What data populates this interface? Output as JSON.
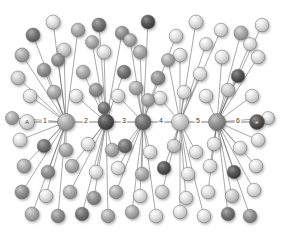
{
  "figure": {
    "type": "network-graph",
    "title": "",
    "background_color": "#ffffff",
    "width": 281,
    "height": 237
  },
  "chart_data": {
    "type": "scatter",
    "title": "",
    "xlabel": "",
    "ylabel": "",
    "legend_position": "none",
    "grid": false,
    "edge_color": "#6e6e6e",
    "edge_width": 0.6,
    "palette": {
      "light": "#dcdcdc",
      "light_mid": "#c8c8c8",
      "mid": "#a8a8a8",
      "mid_dark": "#8a8a8a",
      "dark": "#6b6b6b",
      "darkest": "#4a4a4a"
    },
    "backbone_labels": [
      "1",
      "2",
      "3",
      "4",
      "5",
      "6"
    ],
    "terminal_left_label": "A",
    "terminal_right_label": "e",
    "hubs": [
      {
        "id": "h1",
        "x": 66,
        "y": 122,
        "r": 8.5,
        "shade": "mid"
      },
      {
        "id": "h2",
        "x": 106,
        "y": 122,
        "r": 8.0,
        "shade": "darkest"
      },
      {
        "id": "h3",
        "x": 143,
        "y": 122,
        "r": 8.0,
        "shade": "dark"
      },
      {
        "id": "h4",
        "x": 180,
        "y": 122,
        "r": 8.5,
        "shade": "light_mid"
      },
      {
        "id": "h5",
        "x": 217,
        "y": 122,
        "r": 8.5,
        "shade": "mid_dark"
      }
    ],
    "terminals": [
      {
        "id": "tA",
        "x": 27,
        "y": 122,
        "r": 7.5,
        "shade": "light",
        "label": "A"
      },
      {
        "id": "tE",
        "x": 257,
        "y": 122,
        "r": 7.5,
        "shade": "darkest",
        "label": "e"
      }
    ],
    "backbone_edges": [
      {
        "from": "tA",
        "to": "h1",
        "label": "1",
        "lx": 45,
        "ly": 121
      },
      {
        "from": "h1",
        "to": "h2",
        "label": "2",
        "lx": 86,
        "ly": 121
      },
      {
        "from": "h2",
        "to": "h3",
        "label": "3",
        "lx": 124,
        "ly": 121
      },
      {
        "from": "h3",
        "to": "h4",
        "label": "4",
        "lx": 161,
        "ly": 121
      },
      {
        "from": "h4",
        "to": "h5",
        "label": "5",
        "lx": 198,
        "ly": 121
      },
      {
        "from": "h5",
        "to": "tE",
        "label": "6",
        "lx": 238,
        "ly": 121
      }
    ],
    "leaves": [
      {
        "x": 33,
        "y": 35,
        "r": 7.0,
        "shade": "dark",
        "hub": "h1"
      },
      {
        "x": 53,
        "y": 22,
        "r": 7.0,
        "shade": "light",
        "hub": "h1"
      },
      {
        "x": 78,
        "y": 30,
        "r": 6.8,
        "shade": "mid",
        "hub": "h1"
      },
      {
        "x": 99,
        "y": 25,
        "r": 7.0,
        "shade": "dark",
        "hub": "h2"
      },
      {
        "x": 122,
        "y": 33,
        "r": 6.8,
        "shade": "mid_dark",
        "hub": "h2"
      },
      {
        "x": 148,
        "y": 22,
        "r": 7.0,
        "shade": "darkest",
        "hub": "h3"
      },
      {
        "x": 176,
        "y": 36,
        "r": 6.8,
        "shade": "light",
        "hub": "h3"
      },
      {
        "x": 196,
        "y": 22,
        "r": 7.0,
        "shade": "light",
        "hub": "h4"
      },
      {
        "x": 221,
        "y": 30,
        "r": 6.8,
        "shade": "light",
        "hub": "h4"
      },
      {
        "x": 241,
        "y": 33,
        "r": 7.0,
        "shade": "mid",
        "hub": "h5"
      },
      {
        "x": 262,
        "y": 25,
        "r": 6.8,
        "shade": "light",
        "hub": "h5"
      },
      {
        "x": 22,
        "y": 55,
        "r": 7.0,
        "shade": "mid",
        "hub": "h1"
      },
      {
        "x": 44,
        "y": 70,
        "r": 6.8,
        "shade": "mid_dark",
        "hub": "h1"
      },
      {
        "x": 64,
        "y": 50,
        "r": 7.0,
        "shade": "light_mid",
        "hub": "h1"
      },
      {
        "x": 83,
        "y": 72,
        "r": 6.8,
        "shade": "mid",
        "hub": "h2"
      },
      {
        "x": 104,
        "y": 52,
        "r": 7.0,
        "shade": "light",
        "hub": "h2"
      },
      {
        "x": 124,
        "y": 72,
        "r": 6.8,
        "shade": "dark",
        "hub": "h2"
      },
      {
        "x": 140,
        "y": 52,
        "r": 6.8,
        "shade": "mid",
        "hub": "h3"
      },
      {
        "x": 158,
        "y": 78,
        "r": 7.0,
        "shade": "mid_dark",
        "hub": "h3"
      },
      {
        "x": 180,
        "y": 55,
        "r": 6.8,
        "shade": "light",
        "hub": "h4"
      },
      {
        "x": 200,
        "y": 74,
        "r": 6.8,
        "shade": "light",
        "hub": "h4"
      },
      {
        "x": 222,
        "y": 57,
        "r": 7.0,
        "shade": "light",
        "hub": "h5"
      },
      {
        "x": 238,
        "y": 76,
        "r": 6.8,
        "shade": "darkest",
        "hub": "h5"
      },
      {
        "x": 258,
        "y": 57,
        "r": 6.8,
        "shade": "light",
        "hub": "h5"
      },
      {
        "x": 18,
        "y": 78,
        "r": 7.0,
        "shade": "light_mid",
        "hub": "h1"
      },
      {
        "x": 30,
        "y": 96,
        "r": 6.8,
        "shade": "light",
        "hub": "h1"
      },
      {
        "x": 54,
        "y": 92,
        "r": 6.8,
        "shade": "mid",
        "hub": "h1"
      },
      {
        "x": 76,
        "y": 96,
        "r": 6.8,
        "shade": "light",
        "hub": "h2"
      },
      {
        "x": 96,
        "y": 90,
        "r": 6.8,
        "shade": "mid_dark",
        "hub": "h2"
      },
      {
        "x": 118,
        "y": 96,
        "r": 6.8,
        "shade": "light",
        "hub": "h3"
      },
      {
        "x": 136,
        "y": 88,
        "r": 6.8,
        "shade": "mid",
        "hub": "h3"
      },
      {
        "x": 160,
        "y": 98,
        "r": 6.8,
        "shade": "light",
        "hub": "h4"
      },
      {
        "x": 184,
        "y": 92,
        "r": 6.8,
        "shade": "light",
        "hub": "h4"
      },
      {
        "x": 206,
        "y": 96,
        "r": 6.8,
        "shade": "light",
        "hub": "h5"
      },
      {
        "x": 228,
        "y": 90,
        "r": 6.8,
        "shade": "light_mid",
        "hub": "h5"
      },
      {
        "x": 252,
        "y": 96,
        "r": 6.8,
        "shade": "light",
        "hub": "h5"
      },
      {
        "x": 20,
        "y": 140,
        "r": 7.0,
        "shade": "light",
        "hub": "h1"
      },
      {
        "x": 44,
        "y": 146,
        "r": 6.8,
        "shade": "dark",
        "hub": "h1"
      },
      {
        "x": 66,
        "y": 150,
        "r": 6.8,
        "shade": "mid",
        "hub": "h1"
      },
      {
        "x": 88,
        "y": 144,
        "r": 6.8,
        "shade": "light",
        "hub": "h2"
      },
      {
        "x": 112,
        "y": 150,
        "r": 6.8,
        "shade": "mid",
        "hub": "h2"
      },
      {
        "x": 125,
        "y": 146,
        "r": 7.0,
        "shade": "dark",
        "hub": "h3"
      },
      {
        "x": 150,
        "y": 152,
        "r": 6.8,
        "shade": "light",
        "hub": "h3"
      },
      {
        "x": 174,
        "y": 146,
        "r": 6.8,
        "shade": "light_mid",
        "hub": "h4"
      },
      {
        "x": 196,
        "y": 152,
        "r": 6.8,
        "shade": "light",
        "hub": "h4"
      },
      {
        "x": 214,
        "y": 144,
        "r": 6.8,
        "shade": "light",
        "hub": "h5"
      },
      {
        "x": 240,
        "y": 148,
        "r": 6.8,
        "shade": "light",
        "hub": "h5"
      },
      {
        "x": 258,
        "y": 140,
        "r": 6.8,
        "shade": "light",
        "hub": "h5"
      },
      {
        "x": 24,
        "y": 166,
        "r": 7.0,
        "shade": "mid",
        "hub": "h1"
      },
      {
        "x": 48,
        "y": 172,
        "r": 6.8,
        "shade": "mid_dark",
        "hub": "h1"
      },
      {
        "x": 72,
        "y": 166,
        "r": 6.8,
        "shade": "mid",
        "hub": "h2"
      },
      {
        "x": 96,
        "y": 172,
        "r": 6.8,
        "shade": "light",
        "hub": "h2"
      },
      {
        "x": 118,
        "y": 168,
        "r": 6.8,
        "shade": "light",
        "hub": "h3"
      },
      {
        "x": 142,
        "y": 174,
        "r": 6.8,
        "shade": "mid",
        "hub": "h3"
      },
      {
        "x": 164,
        "y": 168,
        "r": 6.8,
        "shade": "darkest",
        "hub": "h4"
      },
      {
        "x": 188,
        "y": 174,
        "r": 6.8,
        "shade": "light",
        "hub": "h4"
      },
      {
        "x": 210,
        "y": 166,
        "r": 6.8,
        "shade": "light",
        "hub": "h5"
      },
      {
        "x": 234,
        "y": 172,
        "r": 6.8,
        "shade": "darkest",
        "hub": "h5"
      },
      {
        "x": 256,
        "y": 166,
        "r": 6.8,
        "shade": "light",
        "hub": "h5"
      },
      {
        "x": 22,
        "y": 192,
        "r": 7.0,
        "shade": "mid_dark",
        "hub": "h1"
      },
      {
        "x": 46,
        "y": 196,
        "r": 6.8,
        "shade": "light",
        "hub": "h1"
      },
      {
        "x": 70,
        "y": 192,
        "r": 6.8,
        "shade": "mid",
        "hub": "h2"
      },
      {
        "x": 94,
        "y": 198,
        "r": 6.8,
        "shade": "mid_dark",
        "hub": "h2"
      },
      {
        "x": 116,
        "y": 192,
        "r": 6.8,
        "shade": "mid",
        "hub": "h3"
      },
      {
        "x": 140,
        "y": 196,
        "r": 6.8,
        "shade": "light",
        "hub": "h3"
      },
      {
        "x": 162,
        "y": 192,
        "r": 6.8,
        "shade": "light_mid",
        "hub": "h4"
      },
      {
        "x": 186,
        "y": 198,
        "r": 6.8,
        "shade": "light",
        "hub": "h4"
      },
      {
        "x": 208,
        "y": 192,
        "r": 6.8,
        "shade": "light",
        "hub": "h5"
      },
      {
        "x": 232,
        "y": 196,
        "r": 6.8,
        "shade": "light_mid",
        "hub": "h5"
      },
      {
        "x": 254,
        "y": 190,
        "r": 6.8,
        "shade": "light",
        "hub": "h5"
      },
      {
        "x": 32,
        "y": 214,
        "r": 7.0,
        "shade": "mid",
        "hub": "h1"
      },
      {
        "x": 58,
        "y": 216,
        "r": 6.8,
        "shade": "mid_dark",
        "hub": "h1"
      },
      {
        "x": 82,
        "y": 214,
        "r": 6.8,
        "shade": "dark",
        "hub": "h2"
      },
      {
        "x": 108,
        "y": 216,
        "r": 6.8,
        "shade": "mid",
        "hub": "h2"
      },
      {
        "x": 132,
        "y": 212,
        "r": 6.8,
        "shade": "mid",
        "hub": "h3"
      },
      {
        "x": 156,
        "y": 216,
        "r": 6.8,
        "shade": "light",
        "hub": "h3"
      },
      {
        "x": 180,
        "y": 212,
        "r": 6.8,
        "shade": "light",
        "hub": "h4"
      },
      {
        "x": 204,
        "y": 216,
        "r": 6.8,
        "shade": "light",
        "hub": "h4"
      },
      {
        "x": 228,
        "y": 214,
        "r": 6.8,
        "shade": "dark",
        "hub": "h5"
      },
      {
        "x": 250,
        "y": 216,
        "r": 6.8,
        "shade": "mid_dark",
        "hub": "h5"
      },
      {
        "x": 12,
        "y": 118,
        "r": 6.5,
        "shade": "mid",
        "hub": "h1"
      },
      {
        "x": 268,
        "y": 118,
        "r": 6.5,
        "shade": "light",
        "hub": "h5"
      },
      {
        "x": 58,
        "y": 60,
        "r": 6.5,
        "shade": "mid_dark",
        "hub": "h1"
      },
      {
        "x": 168,
        "y": 60,
        "r": 6.5,
        "shade": "mid",
        "hub": "h4"
      },
      {
        "x": 206,
        "y": 44,
        "r": 6.5,
        "shade": "light",
        "hub": "h4"
      },
      {
        "x": 130,
        "y": 40,
        "r": 6.5,
        "shade": "mid",
        "hub": "h3"
      },
      {
        "x": 92,
        "y": 42,
        "r": 6.5,
        "shade": "mid",
        "hub": "h2"
      },
      {
        "x": 250,
        "y": 44,
        "r": 6.5,
        "shade": "light",
        "hub": "h5"
      },
      {
        "x": 148,
        "y": 100,
        "r": 6.5,
        "shade": "mid",
        "hub": "h3"
      },
      {
        "x": 104,
        "y": 108,
        "r": 6.0,
        "shade": "dark",
        "hub": "h2"
      }
    ]
  }
}
